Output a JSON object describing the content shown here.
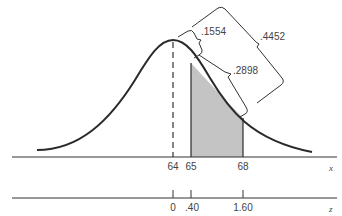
{
  "figure": {
    "colors": {
      "curve": "#2a2a2a",
      "shade": "#c4c4c4",
      "axis": "#333333",
      "text": "#444444"
    },
    "x_axis": {
      "label": "x",
      "ticks": [
        {
          "value": "64",
          "px": 173
        },
        {
          "value": "65",
          "px": 191
        },
        {
          "value": "68",
          "px": 243
        }
      ]
    },
    "z_axis": {
      "label": "z",
      "ticks": [
        {
          "value": "0",
          "px": 173
        },
        {
          "value": ".40",
          "px": 191
        },
        {
          "value": "1.60",
          "px": 243
        }
      ]
    },
    "areas": {
      "mean_to_65": ".1554",
      "shaded_65_to_68": ".2898",
      "mean_to_68": ".4452"
    }
  }
}
